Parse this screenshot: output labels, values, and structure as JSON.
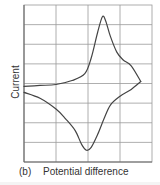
{
  "figure": {
    "panel_label": "(b)",
    "xlabel": "Potential difference",
    "ylabel": "Current"
  },
  "colors": {
    "grid": "#9a9a9a",
    "axis": "#666666",
    "curve": "#444444",
    "text": "#333333"
  },
  "chart_data": {
    "type": "line",
    "title": "",
    "xlabel": "Potential difference",
    "ylabel": "Current",
    "panel_label": "(b)",
    "grid": true,
    "legend": null,
    "x_ticks": [],
    "y_ticks": [],
    "grid_divisions": {
      "x": 4,
      "y": 8
    },
    "xlim": [
      0,
      4
    ],
    "ylim": [
      -4,
      4
    ],
    "series": [
      {
        "name": "forward scan (upper branch)",
        "x": [
          0.0,
          0.5,
          1.0,
          1.5,
          1.9,
          2.1,
          2.3,
          2.45,
          2.55,
          2.7,
          2.9,
          3.1,
          3.35,
          3.65
        ],
        "y": [
          -0.15,
          -0.1,
          -0.05,
          0.15,
          0.5,
          1.3,
          2.6,
          3.4,
          3.2,
          2.4,
          1.6,
          1.2,
          0.9,
          0.1
        ]
      },
      {
        "name": "reverse scan (lower branch)",
        "x": [
          3.65,
          3.35,
          3.0,
          2.7,
          2.5,
          2.3,
          2.1,
          1.95,
          1.8,
          1.6,
          1.3,
          1.0,
          0.5,
          0.0
        ],
        "y": [
          0.1,
          -0.3,
          -0.65,
          -1.1,
          -1.8,
          -2.6,
          -3.25,
          -3.4,
          -3.1,
          -2.4,
          -1.8,
          -1.3,
          -0.75,
          -0.45
        ]
      }
    ]
  }
}
